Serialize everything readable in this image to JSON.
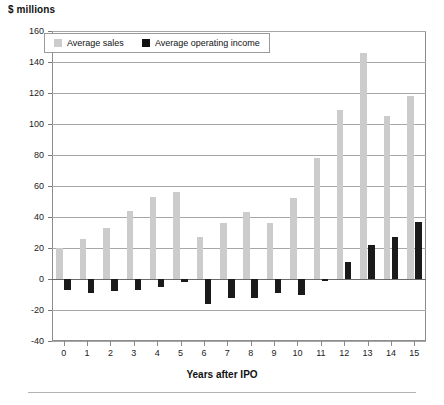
{
  "chart_data": {
    "type": "bar",
    "title": "$ millions",
    "xlabel": "Years after IPO",
    "ylabel": "$ millions",
    "categories": [
      "0",
      "1",
      "2",
      "3",
      "4",
      "5",
      "6",
      "7",
      "8",
      "9",
      "10",
      "11",
      "12",
      "13",
      "14",
      "15"
    ],
    "series": [
      {
        "name": "Average sales",
        "color": "#cccccc",
        "values": [
          20,
          26,
          33,
          44,
          53,
          56,
          27,
          36,
          43,
          36,
          52,
          78,
          109,
          146,
          105,
          118
        ]
      },
      {
        "name": "Average operating income",
        "color": "#111111",
        "values": [
          -7,
          -9,
          -8,
          -7,
          -5,
          -2,
          -16,
          -12,
          -12,
          -9,
          -10,
          -1,
          11,
          22,
          27,
          37
        ]
      }
    ],
    "ylim": [
      -40,
      160
    ],
    "yticks": [
      -40,
      -20,
      0,
      20,
      40,
      60,
      80,
      100,
      120,
      140,
      160
    ],
    "ytick_labels": [
      "-40",
      "-20",
      "0",
      "20",
      "40",
      "60",
      "80",
      "100",
      "120",
      "140",
      "160"
    ],
    "grid": true,
    "legend_position": "top-left",
    "legend_entries": [
      "Average sales",
      "Average operating income"
    ]
  },
  "axis": {
    "y_title": "$ millions",
    "x_title": "Years after IPO"
  },
  "legend": {
    "sales_label": "Average sales",
    "income_label": "Average operating income"
  }
}
